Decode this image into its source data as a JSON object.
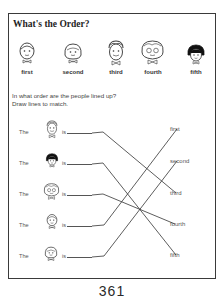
{
  "worksheet": {
    "title": "What's the Order?",
    "lineup": [
      {
        "label": "first",
        "face": "bald-man-face-icon"
      },
      {
        "label": "second",
        "face": "girl-bob-face-icon"
      },
      {
        "label": "third",
        "face": "boy-face-icon"
      },
      {
        "label": "fourth",
        "face": "grandma-glasses-face-icon"
      },
      {
        "label": "fifth",
        "face": "black-hair-girl-face-icon"
      }
    ],
    "instructions": {
      "line1": "In what order are the people lined up?",
      "line2": "Draw lines to match."
    },
    "rows": [
      {
        "the": "The",
        "is": "is",
        "face": "boy-face-icon",
        "matched_to": "third"
      },
      {
        "the": "The",
        "is": "is",
        "face": "black-hair-girl-face-icon",
        "matched_to": "fifth"
      },
      {
        "the": "The",
        "is": "is",
        "face": "grandma-glasses-face-icon",
        "matched_to": "fourth"
      },
      {
        "the": "The",
        "is": "is",
        "face": "bald-man-face-icon",
        "matched_to": "first"
      },
      {
        "the": "The",
        "is": "is",
        "face": "girl-bob-face-icon",
        "matched_to": "second"
      }
    ],
    "answers": [
      "first",
      "second",
      "third",
      "fourth",
      "fifth"
    ],
    "page_number": "361"
  }
}
